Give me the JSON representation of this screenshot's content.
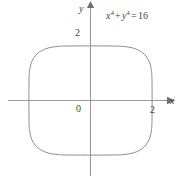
{
  "figure": {
    "colors": {
      "background": "#ffffff",
      "axis": "#9a9a9a",
      "curve": "#8c8c8c",
      "text": "#434343"
    }
  },
  "labels": {
    "y_axis": "y",
    "x_axis": "x",
    "origin": "0",
    "tick_y_2": "2",
    "tick_x_2": "2"
  },
  "equation": {
    "x_base": "x",
    "x_exp": "4",
    "plus": "+",
    "y_base": "y",
    "y_exp": "4",
    "equals": "=",
    "rhs": "16",
    "plain": "x⁴ + y⁴ = 16"
  },
  "chart_data": {
    "type": "line",
    "title": "",
    "subtitle": "",
    "xlabel": "x",
    "ylabel": "y",
    "equation": "x^4 + y^4 = 16",
    "curve_name": "x⁴ + y⁴ = 16",
    "grid": false,
    "legend": null,
    "xlim": [
      -2.65,
      2.6
    ],
    "ylim": [
      -2.45,
      2.75
    ],
    "xticks": [
      2
    ],
    "yticks": [
      2
    ],
    "xtick_labels": [
      "2"
    ],
    "ytick_labels": [
      "2"
    ],
    "origin_label": "0",
    "axis_arrows": [
      "x-positive",
      "y-positive"
    ],
    "closed_curve": true,
    "x_intercepts": [
      -2,
      2
    ],
    "y_intercepts": [
      -2,
      2
    ],
    "points": [
      {
        "x": 2.0,
        "y": 0.0
      },
      {
        "x": 1.995,
        "y": 0.795
      },
      {
        "x": 1.98,
        "y": 1.06
      },
      {
        "x": 1.95,
        "y": 1.27
      },
      {
        "x": 1.9,
        "y": 1.44
      },
      {
        "x": 1.8,
        "y": 1.63
      },
      {
        "x": 1.7,
        "y": 1.74
      },
      {
        "x": 1.6,
        "y": 1.82
      },
      {
        "x": 1.44,
        "y": 1.9
      },
      {
        "x": 1.27,
        "y": 1.95
      },
      {
        "x": 1.06,
        "y": 1.98
      },
      {
        "x": 0.795,
        "y": 1.995
      },
      {
        "x": 0.0,
        "y": 2.0
      },
      {
        "x": -0.795,
        "y": 1.995
      },
      {
        "x": -1.06,
        "y": 1.98
      },
      {
        "x": -1.27,
        "y": 1.95
      },
      {
        "x": -1.44,
        "y": 1.9
      },
      {
        "x": -1.6,
        "y": 1.82
      },
      {
        "x": -1.7,
        "y": 1.74
      },
      {
        "x": -1.8,
        "y": 1.63
      },
      {
        "x": -1.9,
        "y": 1.44
      },
      {
        "x": -1.95,
        "y": 1.27
      },
      {
        "x": -1.98,
        "y": 1.06
      },
      {
        "x": -1.995,
        "y": 0.795
      },
      {
        "x": -2.0,
        "y": 0.0
      },
      {
        "x": -1.995,
        "y": -0.795
      },
      {
        "x": -1.98,
        "y": -1.06
      },
      {
        "x": -1.95,
        "y": -1.27
      },
      {
        "x": -1.9,
        "y": -1.44
      },
      {
        "x": -1.8,
        "y": -1.63
      },
      {
        "x": -1.7,
        "y": -1.74
      },
      {
        "x": -1.6,
        "y": -1.82
      },
      {
        "x": -1.44,
        "y": -1.9
      },
      {
        "x": -1.27,
        "y": -1.95
      },
      {
        "x": -1.06,
        "y": -1.98
      },
      {
        "x": -0.795,
        "y": -1.995
      },
      {
        "x": 0.0,
        "y": -2.0
      },
      {
        "x": 0.795,
        "y": -1.995
      },
      {
        "x": 1.06,
        "y": -1.98
      },
      {
        "x": 1.27,
        "y": -1.95
      },
      {
        "x": 1.44,
        "y": -1.9
      },
      {
        "x": 1.6,
        "y": -1.82
      },
      {
        "x": 1.7,
        "y": -1.74
      },
      {
        "x": 1.8,
        "y": -1.63
      },
      {
        "x": 1.9,
        "y": -1.44
      },
      {
        "x": 1.95,
        "y": -1.27
      },
      {
        "x": 1.98,
        "y": -1.06
      },
      {
        "x": 1.995,
        "y": -0.795
      },
      {
        "x": 2.0,
        "y": 0.0
      }
    ]
  }
}
